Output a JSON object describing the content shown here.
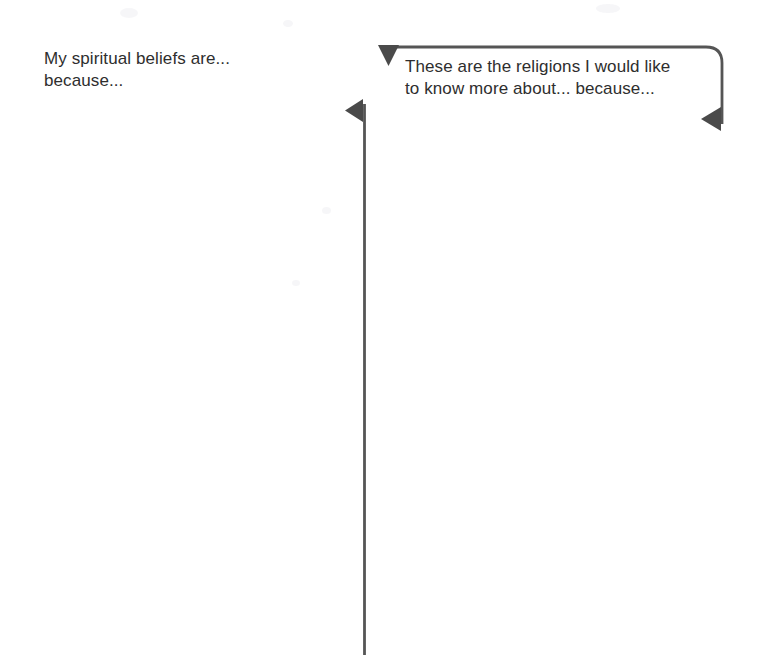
{
  "page": {
    "background_color": "#ffffff",
    "width": 771,
    "height": 655
  },
  "worksheet": {
    "prompts": [
      {
        "id": "spiritual-beliefs",
        "text": "My spiritual beliefs are...\nbecause...",
        "line1": "My spiritual beliefs are...",
        "line2": "because...",
        "text_color": "#2e2e2e"
      },
      {
        "id": "religions-to-learn",
        "text": "These are the religions I would like\nto know more about... because...",
        "line1": "These are the religions I would like",
        "line2": "to know more about... because...",
        "text_color": "#2e2e2e"
      }
    ],
    "connectors": {
      "line_color": "#555555",
      "line_width": 2.6,
      "items": [
        {
          "id": "vertical-divider",
          "description": "vertical rule from y=105 to bottom edge at x=364",
          "arrowhead": "left-pointing-triangle"
        },
        {
          "id": "right-prompt-bracket",
          "description": "horizontal rule with rounded right corner turning down",
          "arrowhead_start": "down-pointing-triangle",
          "arrowhead_end": "left-pointing-triangle"
        }
      ]
    }
  }
}
